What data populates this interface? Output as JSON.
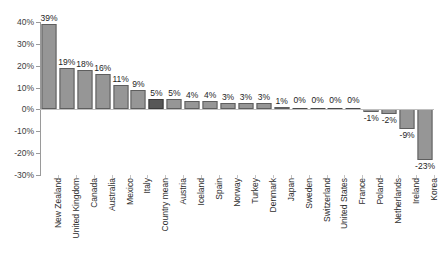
{
  "chart_data": {
    "type": "bar",
    "title": "",
    "subtitle": "",
    "xlabel": "",
    "ylabel": "",
    "ylim": [
      -30,
      40
    ],
    "ytick_labels": [
      "40%",
      "30%",
      "20%",
      "10%",
      "0%",
      "-10%",
      "-20%",
      "-30%"
    ],
    "ytick_values": [
      40,
      30,
      20,
      10,
      0,
      -10,
      -20,
      -30
    ],
    "grid": false,
    "legend": "none",
    "highlight_category": "Country mean",
    "colors": {
      "bar": "#969696",
      "bar_border": "#5e5e5e",
      "highlight": "#575757",
      "highlight_border": "#3a3a3a",
      "axis": "#9a9a9a",
      "text": "#2e2e2e"
    },
    "categories": [
      "New Zealand",
      "United Kingdom",
      "Canada",
      "Australia",
      "Mexico",
      "Italy",
      "Country mean",
      "Austria",
      "Iceland",
      "Spain",
      "Norway",
      "Turkey",
      "Denmark",
      "Japan",
      "Sweden",
      "Switzerland",
      "United States",
      "France",
      "Poland",
      "Netherlands",
      "Ireland",
      "Korea"
    ],
    "values": [
      39,
      19,
      18,
      16,
      11,
      9,
      5,
      5,
      4,
      4,
      3,
      3,
      3,
      1,
      0,
      0,
      0,
      0,
      -1,
      -2,
      -9,
      -23
    ],
    "data_labels": [
      "39%",
      "19%",
      "18%",
      "16%",
      "11%",
      "9%",
      "5%",
      "5%",
      "4%",
      "4%",
      "3%",
      "3%",
      "3%",
      "1%",
      "0%",
      "0%",
      "0%",
      "0%",
      "-1%",
      "-2%",
      "-9%",
      "-23%"
    ]
  }
}
